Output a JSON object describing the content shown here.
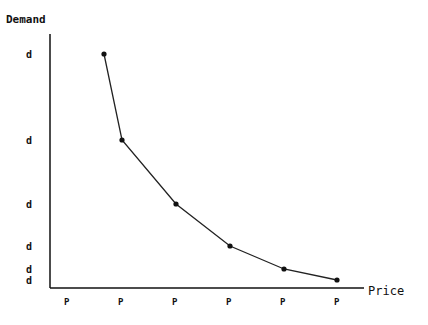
{
  "chart_data": {
    "type": "line",
    "title": "",
    "xlabel": "Price",
    "ylabel": "Demand",
    "x_tick_labels": [
      "P",
      "P",
      "P",
      "P",
      "P",
      "P"
    ],
    "y_tick_labels": [
      "d",
      "d",
      "d",
      "d",
      "d",
      "d"
    ],
    "note": "Axes have no numeric scale (ticks labeled only 'P' and 'd'); values below are pixel-derived relative heights above the x-axis.",
    "points_px": [
      {
        "x": 104,
        "y": 54
      },
      {
        "x": 122,
        "y": 140
      },
      {
        "x": 176,
        "y": 204
      },
      {
        "x": 230,
        "y": 246
      },
      {
        "x": 284,
        "y": 269
      },
      {
        "x": 337,
        "y": 280
      }
    ],
    "relative_values": [
      234,
      148,
      84,
      42,
      19,
      8
    ],
    "grid": false,
    "legend": null
  },
  "axes": {
    "origin": {
      "x": 50,
      "y": 288
    },
    "y_top": 34,
    "x_right": 364,
    "x_ticks_px": [
      67,
      121,
      175,
      229,
      283,
      337
    ],
    "y_ticks_px": [
      54,
      140,
      204,
      246,
      269,
      280
    ]
  },
  "colors": {
    "line": "#222222",
    "axis": "#111111",
    "background": "#ffffff"
  }
}
